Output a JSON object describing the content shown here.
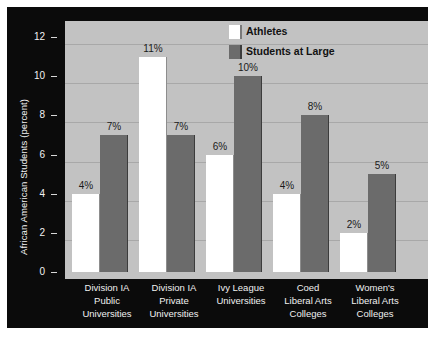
{
  "chart_data": {
    "type": "bar",
    "title": "",
    "xlabel": "",
    "ylabel": "African American Students (percent)",
    "ylim": [
      0,
      12
    ],
    "yticks": [
      "0",
      "2",
      "4",
      "6",
      "8",
      "10",
      "12"
    ],
    "grid": true,
    "legend_position": "top-right",
    "categories": [
      "Division IA Public Universities",
      "Division IA Private Universities",
      "Ivy League Universities",
      "Coed Liberal Arts Colleges",
      "Women's Liberal Arts Colleges"
    ],
    "category_lines": [
      [
        "Division IA",
        "Public",
        "Universities"
      ],
      [
        "Division IA",
        "Private",
        "Universities"
      ],
      [
        "Ivy League",
        "Universities"
      ],
      [
        "Coed",
        "Liberal Arts",
        "Colleges"
      ],
      [
        "Women's",
        "Liberal Arts",
        "Colleges"
      ]
    ],
    "series": [
      {
        "name": "Athletes",
        "color": "#ffffff",
        "values": [
          4,
          11,
          6,
          4,
          2
        ],
        "labels": [
          "4%",
          "11%",
          "6%",
          "4%",
          "2%"
        ]
      },
      {
        "name": "Students at Large",
        "color": "#6b6b6b",
        "values": [
          7,
          7,
          10,
          8,
          5
        ],
        "labels": [
          "7%",
          "7%",
          "10%",
          "8%",
          "5%"
        ]
      }
    ]
  },
  "legend": {
    "items": [
      {
        "label": "Athletes",
        "swatch": "white"
      },
      {
        "label": "Students at Large",
        "swatch": "dark"
      }
    ]
  },
  "axis": {
    "y_title": "African American Students (percent)",
    "y_tick_labels": [
      "12",
      "10",
      "8",
      "6",
      "4",
      "2",
      "0"
    ]
  },
  "colors": {
    "panel_background": "#0b0b0b",
    "plot_background": "#c2c2c2",
    "gridline": "#a8a8a8",
    "athletes_bar": "#ffffff",
    "students_bar": "#6b6b6b",
    "axis_text": "#f2f2f2",
    "value_label": "#1a1a1a"
  }
}
